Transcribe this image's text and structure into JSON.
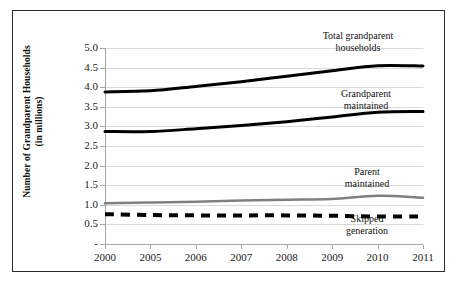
{
  "chart_data": {
    "type": "line",
    "title": "",
    "xlabel": "",
    "ylabel": "Number of Grandparent Households (in millions)",
    "ylabel_line1": "Number of Grandparent Households",
    "ylabel_line2": "(in millions)",
    "categories": [
      "2000",
      "2005",
      "2006",
      "2007",
      "2008",
      "2009",
      "2010",
      "2011"
    ],
    "x": [
      "2000",
      "2005",
      "2006",
      "2007",
      "2008",
      "2009",
      "2010",
      "2011"
    ],
    "ylim": [
      0,
      5.0
    ],
    "yticks": [
      "-",
      "0.5",
      "1.0",
      "1.5",
      "2.0",
      "2.5",
      "3.0",
      "3.5",
      "4.0",
      "4.5",
      "5.0"
    ],
    "ytick_values": [
      0,
      0.5,
      1.0,
      1.5,
      2.0,
      2.5,
      3.0,
      3.5,
      4.0,
      4.5,
      5.0
    ],
    "grid": true,
    "legend_position": "inline-annotations",
    "series": [
      {
        "name": "Total grandparent households",
        "label_line1": "Total grandparent",
        "label_line2": "households",
        "values": [
          3.88,
          3.91,
          4.02,
          4.14,
          4.28,
          4.42,
          4.55,
          4.54
        ],
        "color": "#000000",
        "style": "solid",
        "width": 3
      },
      {
        "name": "Grandparent maintained",
        "label_line1": "Grandparent",
        "label_line2": "maintained",
        "values": [
          2.87,
          2.87,
          2.94,
          3.02,
          3.12,
          3.24,
          3.36,
          3.38
        ],
        "color": "#000000",
        "style": "solid",
        "width": 3
      },
      {
        "name": "Parent maintained",
        "label_line1": "Parent",
        "label_line2": "maintained",
        "values": [
          1.04,
          1.06,
          1.08,
          1.11,
          1.13,
          1.15,
          1.23,
          1.18
        ],
        "color": "#808080",
        "style": "solid",
        "width": 2.5
      },
      {
        "name": "Skipped generation",
        "label_line1": "Skipped",
        "label_line2": "generation",
        "values": [
          0.76,
          0.74,
          0.73,
          0.73,
          0.73,
          0.72,
          0.7,
          0.7
        ],
        "color": "#000000",
        "style": "dashed",
        "width": 4
      }
    ]
  },
  "annotations": {
    "total": {
      "line1": "Total grandparent",
      "line2": "households"
    },
    "grandparent": {
      "line1": "Grandparent",
      "line2": "maintained"
    },
    "parent": {
      "line1": "Parent",
      "line2": "maintained"
    },
    "skipped": {
      "line1": "Skipped",
      "line2": "generation"
    }
  }
}
